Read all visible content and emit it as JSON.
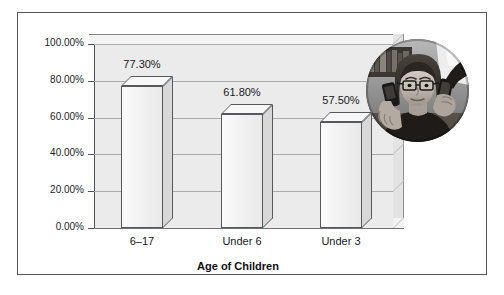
{
  "chart_data": {
    "type": "bar",
    "title": "",
    "subtitle": "",
    "xlabel": "Age of Children",
    "ylabel": "",
    "categories": [
      "6–17",
      "Under 6",
      "Under 3"
    ],
    "values": [
      77.3,
      61.8,
      57.5
    ],
    "data_labels": [
      "77.30%",
      "61.80%",
      "57.50%"
    ],
    "ylim": [
      0,
      100
    ],
    "ytick_values": [
      0,
      20,
      40,
      60,
      80,
      100
    ],
    "ytick_labels": [
      "0.00%",
      "20.00%",
      "40.00%",
      "60.00%",
      "80.00%",
      "100.00%"
    ],
    "grid": true,
    "legend": "none",
    "style": "3d-column",
    "series": [
      {
        "name": "Percent",
        "values": [
          77.3,
          61.8,
          57.5
        ]
      }
    ]
  },
  "figure": {
    "frame_color": "#55595c",
    "background": "#ffffff",
    "plot_fill": "#ebebeb",
    "bar_fill": "#f2f2f2",
    "bar_outline": "#55595c"
  },
  "photo": {
    "name": "woman-on-two-phones-photo",
    "description": "Grayscale circular photograph of a woman wearing glasses holding a mobile phone in each hand up to her ears",
    "shape": "circle"
  },
  "axis_title": "Age of Children"
}
